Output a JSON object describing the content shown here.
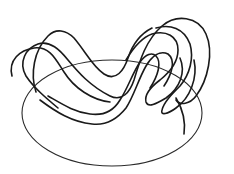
{
  "figure": {
    "stroke_color": "#1a1a1a",
    "ellipse_color": "#2a2a2a",
    "background": "#ffffff",
    "ellipse": {
      "cx": 112,
      "cy": 113,
      "rx": 90,
      "ry": 53
    },
    "knot_path": "M 60 112 C 50 106, 32 96, 20 88 C 8 80, 10 62, 22 54 C 34 46, 50 44, 60 52 C 68 58, 76 70, 84 80 C 94 92, 116 96, 128 88 C 140 80, 132 64, 142 56 C 150 50, 160 60, 156 74 C 152 88, 150 100, 158 104 C 166 108, 176 98, 180 86 C 186 72, 186 52, 170 44 C 156 38, 140 40, 128 48 C 118 54, 112 62, 108 68 C 102 76, 100 82, 96 86",
    "outer_path": "M 70 96 C 60 88, 46 76, 40 66 C 30 52, 36 34, 48 28 C 60 22, 72 26, 80 36 C 88 46, 90 56, 100 64 C 110 72, 122 66, 130 56 C 140 44, 150 30, 166 24 C 182 18, 200 26, 206 46 C 212 66, 204 90, 196 104 C 188 116, 178 116, 170 112 C 162 108, 166 96, 172 88 C 178 80, 178 70, 170 72 C 160 74, 150 86, 146 98 C 142 108, 130 108, 124 100 C 116 92, 124 80, 130 72 C 138 62, 150 46, 164 36"
  }
}
